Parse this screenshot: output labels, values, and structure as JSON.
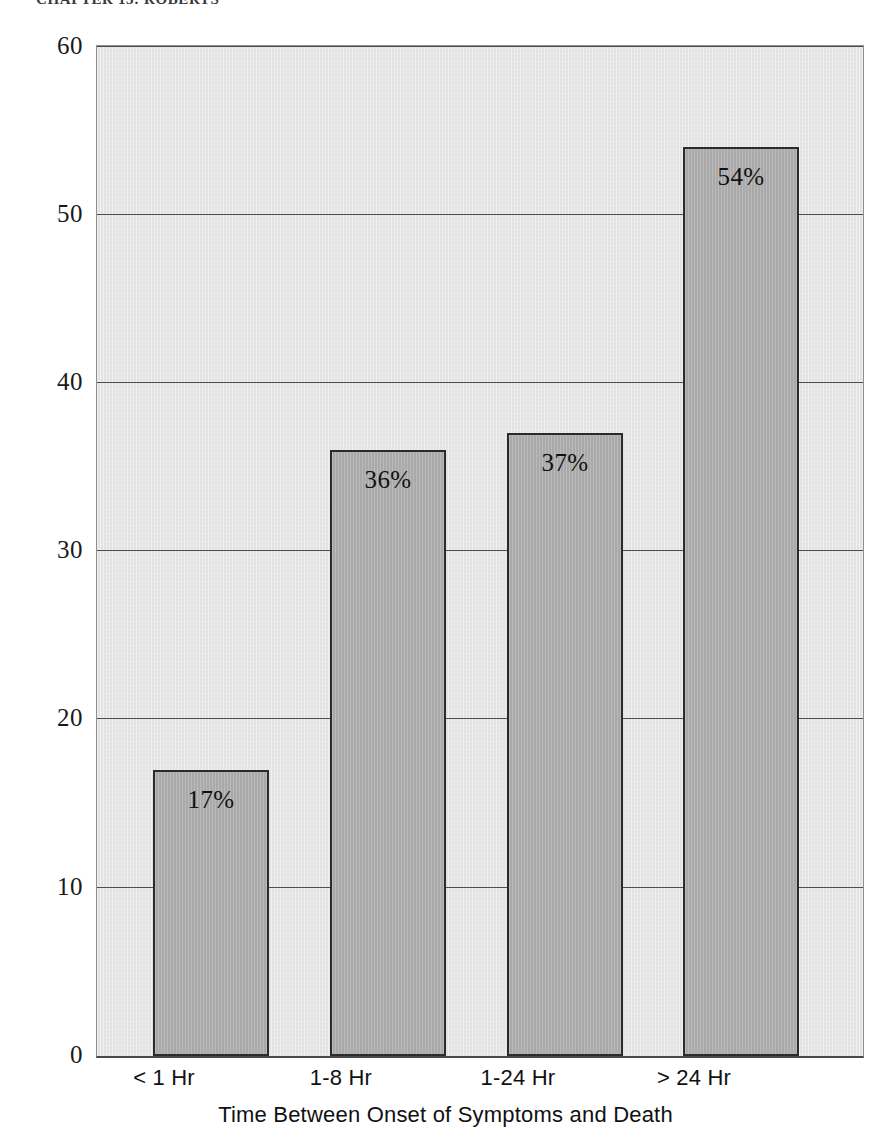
{
  "page": {
    "running_head": "CHAPTER 13: ROBERTS"
  },
  "chart_data": {
    "type": "bar",
    "title": "",
    "subtitle": "",
    "xlabel": "Time Between Onset of Symptoms and Death",
    "ylabel": "Percent with Thrombi",
    "categories": [
      "< 1 Hr",
      "1-8 Hr",
      "1-24 Hr",
      "> 24 Hr"
    ],
    "values": [
      17,
      36,
      37,
      54
    ],
    "value_labels": [
      "17%",
      "36%",
      "37%",
      "54%"
    ],
    "ylim": [
      0,
      60
    ],
    "yticks": [
      0,
      10,
      20,
      30,
      40,
      50,
      60
    ],
    "ytick_labels": [
      "0",
      "10",
      "20",
      "30",
      "40",
      "50",
      "60"
    ],
    "grid": true,
    "grid_axis": "y",
    "legend": false,
    "legend_position": "none",
    "bar_fill_color": "#a9a9a9",
    "bar_edge_color": "#2b2b2b",
    "plot_background_color": "#e4e4e4",
    "gridline_color": "#4e4e4e",
    "text_color": "#111111"
  }
}
